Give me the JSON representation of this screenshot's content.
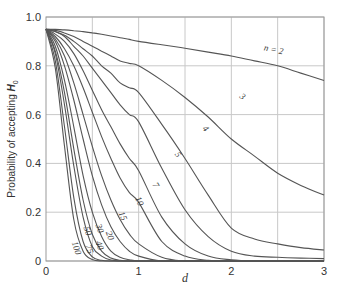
{
  "chart_data": {
    "type": "line",
    "title": "",
    "xlabel": "d",
    "ylabel": "Probability of accepting H0",
    "xlim": [
      0,
      3
    ],
    "ylim": [
      0,
      1.0
    ],
    "grid": true,
    "x_ticks": [
      "0",
      "1",
      "2",
      "3"
    ],
    "x_gridlines": [
      0.5,
      1,
      1.5,
      2,
      2.5,
      3
    ],
    "y_ticks": [
      "0",
      "0.2",
      "0.4",
      "0.6",
      "0.8",
      "1.0"
    ],
    "legend": "inline curve labels",
    "x": [
      0,
      0.1,
      0.2,
      0.3,
      0.4,
      0.5,
      0.6,
      0.7,
      0.8,
      0.9,
      1.0,
      1.25,
      1.5,
      1.75,
      2.0,
      2.25,
      2.5,
      2.75,
      3.0
    ],
    "series": [
      {
        "name": "n = 2",
        "label": "n = 2",
        "values": [
          0.95,
          0.949,
          0.947,
          0.944,
          0.94,
          0.935,
          0.929,
          0.922,
          0.915,
          0.908,
          0.9,
          0.886,
          0.872,
          0.856,
          0.84,
          0.82,
          0.8,
          0.77,
          0.74
        ]
      },
      {
        "name": "3",
        "label": "3",
        "values": [
          0.95,
          0.945,
          0.935,
          0.92,
          0.9,
          0.88,
          0.86,
          0.84,
          0.82,
          0.81,
          0.8,
          0.74,
          0.67,
          0.59,
          0.5,
          0.43,
          0.36,
          0.31,
          0.27
        ]
      },
      {
        "name": "4",
        "label": "4",
        "values": [
          0.95,
          0.94,
          0.925,
          0.9,
          0.87,
          0.84,
          0.8,
          0.77,
          0.73,
          0.71,
          0.69,
          0.56,
          0.42,
          0.27,
          0.135,
          0.09,
          0.07,
          0.055,
          0.045
        ]
      },
      {
        "name": "5",
        "label": "5",
        "values": [
          0.95,
          0.94,
          0.92,
          0.88,
          0.84,
          0.79,
          0.74,
          0.69,
          0.64,
          0.6,
          0.57,
          0.38,
          0.21,
          0.1,
          0.04,
          0.02,
          0.015,
          0.012,
          0.01
        ]
      },
      {
        "name": "7",
        "label": "7",
        "values": [
          0.95,
          0.93,
          0.9,
          0.85,
          0.78,
          0.7,
          0.62,
          0.55,
          0.48,
          0.42,
          0.37,
          0.18,
          0.07,
          0.02,
          0.005,
          0,
          0,
          0,
          0
        ]
      },
      {
        "name": "10",
        "label": "10",
        "values": [
          0.95,
          0.92,
          0.87,
          0.8,
          0.71,
          0.61,
          0.51,
          0.42,
          0.34,
          0.28,
          0.24,
          0.08,
          0.02,
          0.003,
          0,
          0,
          0,
          0,
          0
        ]
      },
      {
        "name": "15",
        "label": "15",
        "values": [
          0.95,
          0.91,
          0.84,
          0.73,
          0.6,
          0.47,
          0.35,
          0.25,
          0.17,
          0.11,
          0.07,
          0.015,
          0,
          0,
          0,
          0,
          0,
          0,
          0
        ]
      },
      {
        "name": "20",
        "label": "20",
        "values": [
          0.95,
          0.9,
          0.8,
          0.66,
          0.5,
          0.35,
          0.23,
          0.14,
          0.08,
          0.04,
          0.02,
          0,
          0,
          0,
          0,
          0,
          0,
          0,
          0
        ]
      },
      {
        "name": "30",
        "label": "30",
        "values": [
          0.95,
          0.88,
          0.74,
          0.55,
          0.35,
          0.2,
          0.1,
          0.04,
          0.015,
          0.005,
          0,
          0,
          0,
          0,
          0,
          0,
          0,
          0,
          0
        ]
      },
      {
        "name": "40",
        "label": "40",
        "values": [
          0.95,
          0.86,
          0.69,
          0.46,
          0.25,
          0.11,
          0.04,
          0.012,
          0.003,
          0,
          0,
          0,
          0,
          0,
          0,
          0,
          0,
          0,
          0
        ]
      },
      {
        "name": "50",
        "label": "50",
        "values": [
          0.95,
          0.85,
          0.64,
          0.39,
          0.18,
          0.06,
          0.02,
          0.004,
          0,
          0,
          0,
          0,
          0,
          0,
          0,
          0,
          0,
          0,
          0
        ]
      },
      {
        "name": "75",
        "label": "75",
        "values": [
          0.95,
          0.82,
          0.55,
          0.26,
          0.08,
          0.017,
          0.003,
          0,
          0,
          0,
          0,
          0,
          0,
          0,
          0,
          0,
          0,
          0,
          0
        ]
      },
      {
        "name": "100",
        "label": "100",
        "values": [
          0.95,
          0.79,
          0.47,
          0.17,
          0.04,
          0.006,
          0,
          0,
          0,
          0,
          0,
          0,
          0,
          0,
          0,
          0,
          0,
          0,
          0
        ]
      }
    ],
    "labels_pos": [
      {
        "text": "n = 2",
        "x": 2.45,
        "y": 0.855,
        "rot": 12
      },
      {
        "text": "3",
        "x": 2.1,
        "y": 0.665,
        "rot": 40
      },
      {
        "text": "4",
        "x": 1.7,
        "y": 0.535,
        "rot": 50
      },
      {
        "text": "5",
        "x": 1.4,
        "y": 0.43,
        "rot": 55
      },
      {
        "text": "7",
        "x": 1.16,
        "y": 0.305,
        "rot": 60
      },
      {
        "text": "10",
        "x": 0.98,
        "y": 0.24,
        "rot": 65
      },
      {
        "text": "15",
        "x": 0.8,
        "y": 0.18,
        "rot": 68
      },
      {
        "text": "20",
        "x": 0.66,
        "y": 0.1,
        "rot": 70
      },
      {
        "text": "30",
        "x": 0.55,
        "y": 0.13,
        "rot": 72
      },
      {
        "text": "40",
        "x": 0.55,
        "y": 0.06,
        "rot": 72
      },
      {
        "text": "50",
        "x": 0.42,
        "y": 0.12,
        "rot": 72
      },
      {
        "text": "75",
        "x": 0.44,
        "y": 0.045,
        "rot": 72
      },
      {
        "text": "100",
        "x": 0.3,
        "y": 0.05,
        "rot": 72
      }
    ]
  },
  "colors": {
    "curve": "#555555",
    "grid": "#c8c8c8",
    "axis": "#999999",
    "text": "#333333"
  }
}
